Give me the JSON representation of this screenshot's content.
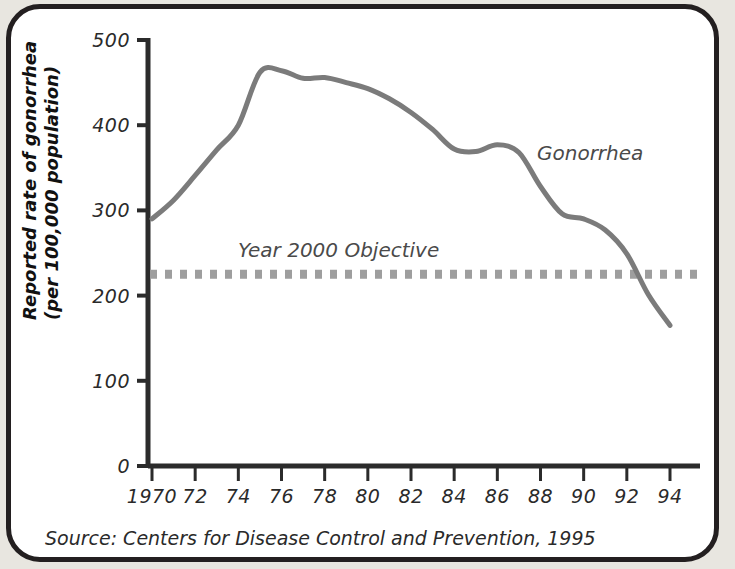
{
  "figure": {
    "background_color": "#ffffff",
    "frame_color": "#231f20",
    "outer_color": "#e8e6e0"
  },
  "source_note": "Source: Centers for Disease Control and Prevention, 1995",
  "chart_data": {
    "type": "line",
    "title": "",
    "xlabel": "",
    "ylabel": "Reported rate of gonorrhea (per 100,000 population)",
    "ylabel_line1": "Reported rate of gonorrhea",
    "ylabel_line2": "(per 100,000 population)",
    "xlim": [
      1970,
      1994
    ],
    "ylim": [
      0,
      500
    ],
    "yticks": [
      0,
      100,
      200,
      300,
      400,
      500
    ],
    "ytick_labels": [
      "0",
      "100",
      "200",
      "300",
      "400",
      "500"
    ],
    "xticks": [
      1970,
      1972,
      1974,
      1976,
      1978,
      1980,
      1982,
      1984,
      1986,
      1988,
      1990,
      1992,
      1994
    ],
    "xtick_labels": [
      "1970",
      "72",
      "74",
      "76",
      "78",
      "80",
      "82",
      "84",
      "86",
      "88",
      "90",
      "92",
      "94"
    ],
    "grid": false,
    "legend_position": "inline-annotation",
    "series": [
      {
        "name": "Gonorrhea",
        "label": "Gonorrhea",
        "color": "#7b7b7b",
        "style": "solid",
        "linewidth": 5,
        "x": [
          1970,
          1971,
          1972,
          1973,
          1974,
          1975,
          1976,
          1977,
          1978,
          1979,
          1980,
          1981,
          1982,
          1983,
          1984,
          1985,
          1986,
          1987,
          1988,
          1989,
          1990,
          1991,
          1992,
          1993,
          1994
        ],
        "values": [
          290,
          312,
          341,
          371,
          400,
          462,
          464,
          455,
          456,
          450,
          443,
          431,
          415,
          395,
          372,
          369,
          377,
          368,
          328,
          296,
          290,
          277,
          249,
          201,
          165
        ]
      },
      {
        "name": "Year 2000 Objective",
        "label": "Year 2000 Objective",
        "color": "#9e9e9e",
        "style": "dotted",
        "linewidth": 9,
        "value": 225,
        "x": [
          1970,
          1994
        ],
        "values": [
          225,
          225
        ]
      }
    ],
    "annotations": [
      {
        "text": "Gonorrhea",
        "x": 1987.0,
        "y": 390,
        "color": "#4a4a4a"
      },
      {
        "text": "Year 2000 Objective",
        "x": 1977.4,
        "y": 258,
        "color": "#4a4a4a"
      }
    ]
  }
}
